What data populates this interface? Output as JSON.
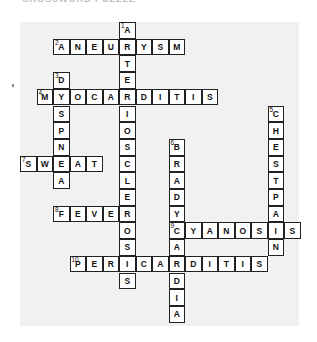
{
  "header": {
    "title": "CROSSWORD PUZZLE"
  },
  "grid": {
    "cell_w": 16.5,
    "cell_h": 16.7
  },
  "entries": [
    {
      "number": "1",
      "answer": "ARTERIOSCLEROSIS",
      "dir": "down",
      "col": 6,
      "row": 0
    },
    {
      "number": "2",
      "answer": "ANEURYSM",
      "dir": "across",
      "col": 2,
      "row": 1
    },
    {
      "number": "3",
      "answer": "DYSPNEA",
      "dir": "down",
      "col": 2,
      "row": 3
    },
    {
      "number": "4",
      "answer": "MYOCARDITIS",
      "dir": "across",
      "col": 1,
      "row": 4
    },
    {
      "number": "5",
      "answer": "CHESTPAIN",
      "dir": "down",
      "col": 15,
      "row": 5
    },
    {
      "number": "6",
      "answer": "BRADYCARDIA",
      "dir": "down",
      "col": 9,
      "row": 7
    },
    {
      "number": "7",
      "answer": "SWEAT",
      "dir": "across",
      "col": 0,
      "row": 8
    },
    {
      "number": "8",
      "answer": "FEVER",
      "dir": "across",
      "col": 2,
      "row": 11
    },
    {
      "number": "9",
      "answer": "CYANOSIS",
      "dir": "across",
      "col": 9,
      "row": 12
    },
    {
      "number": "10",
      "answer": "PERICARDITIS",
      "dir": "across",
      "col": 3,
      "row": 14
    }
  ]
}
